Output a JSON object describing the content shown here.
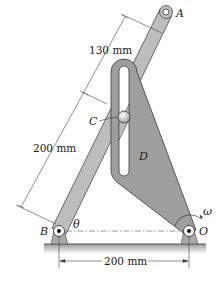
{
  "diagram": {
    "type": "mechanism",
    "labels": {
      "point_a": "A",
      "point_b": "B",
      "point_c": "C",
      "body_d": "D",
      "point_o": "O",
      "angle": "θ",
      "angular_velocity": "ω"
    },
    "dimensions": {
      "upper_arm_segment": "130 mm",
      "lower_arm_segment": "200 mm",
      "base_span": "200 mm"
    },
    "colors": {
      "arm_fill": "#b9b9b9",
      "plate_fill": "#9d9d9d",
      "outline": "#3a3a3a",
      "ground": "#8a8a8a",
      "background": "#ffffff"
    }
  }
}
